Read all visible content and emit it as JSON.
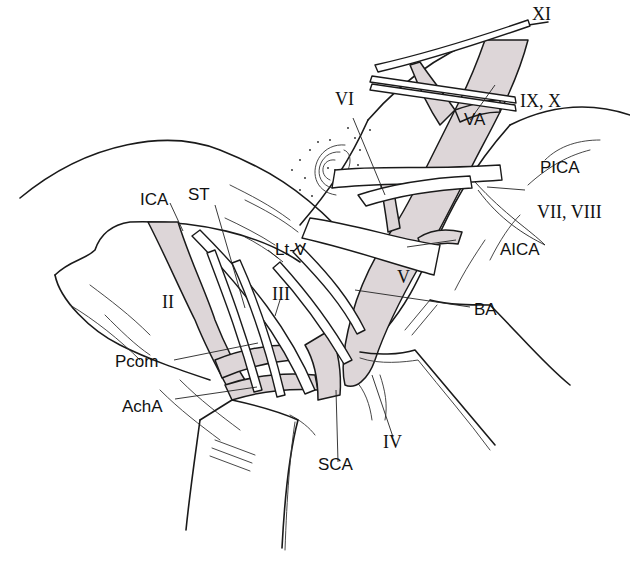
{
  "figure": {
    "shade_color": "#ddd6d8",
    "line_color": "#1a1a1a"
  },
  "labels": {
    "xi": "XI",
    "ix_x": "IX, X",
    "vi": "VI",
    "va": "VA",
    "pica": "PICA",
    "vii_viii": "VII, VIII",
    "ica": "ICA",
    "st": "ST",
    "lt_v": "Lt-V",
    "aica": "AICA",
    "v": "V",
    "ii": "II",
    "iii": "III",
    "ba": "BA",
    "pcom": "Pcom",
    "acha": "AchA",
    "iv": "IV",
    "sca": "SCA"
  }
}
